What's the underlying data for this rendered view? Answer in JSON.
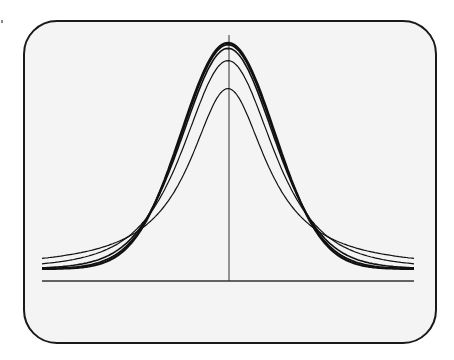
{
  "chart_data": {
    "type": "line",
    "title": "",
    "xlabel": "",
    "ylabel": "",
    "grid": false,
    "legend": null,
    "xlim": [
      -4,
      4
    ],
    "ylim": [
      0,
      0.42
    ],
    "center_line_x": 0,
    "series": [
      {
        "name": "df=1",
        "peak": 0.318,
        "df": 1,
        "stroke": 1.2
      },
      {
        "name": "df=3",
        "peak": 0.368,
        "df": 3,
        "stroke": 1.2
      },
      {
        "name": "df=10",
        "peak": 0.389,
        "df": 10,
        "stroke": 1.6
      },
      {
        "name": "df=30",
        "peak": 0.396,
        "df": 30,
        "stroke": 1.8
      },
      {
        "name": "normal",
        "peak": 0.399,
        "df": null,
        "stroke": 2.2
      }
    ],
    "colors": {
      "line": "#111111",
      "frame": "#1a1a1a",
      "background": "#f4f4f4"
    }
  }
}
